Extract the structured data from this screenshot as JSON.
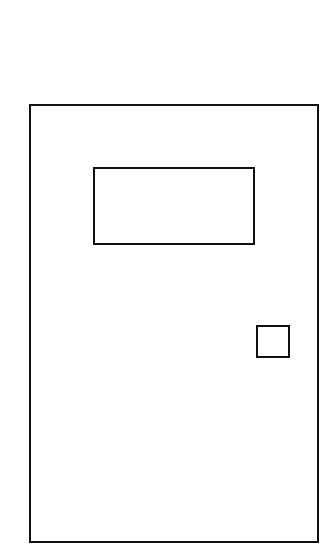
{
  "drawing": {
    "subject": "door",
    "stroke_color": "#111111",
    "background_color": "#ffffff",
    "shapes": [
      {
        "name": "door-frame",
        "type": "rectangle",
        "x": 29,
        "y": 104,
        "width": 290,
        "height": 439
      },
      {
        "name": "door-window",
        "type": "rectangle",
        "x": 93,
        "y": 167,
        "width": 162,
        "height": 78
      },
      {
        "name": "door-handle",
        "type": "rectangle",
        "x": 256,
        "y": 325,
        "width": 34,
        "height": 33
      }
    ]
  }
}
